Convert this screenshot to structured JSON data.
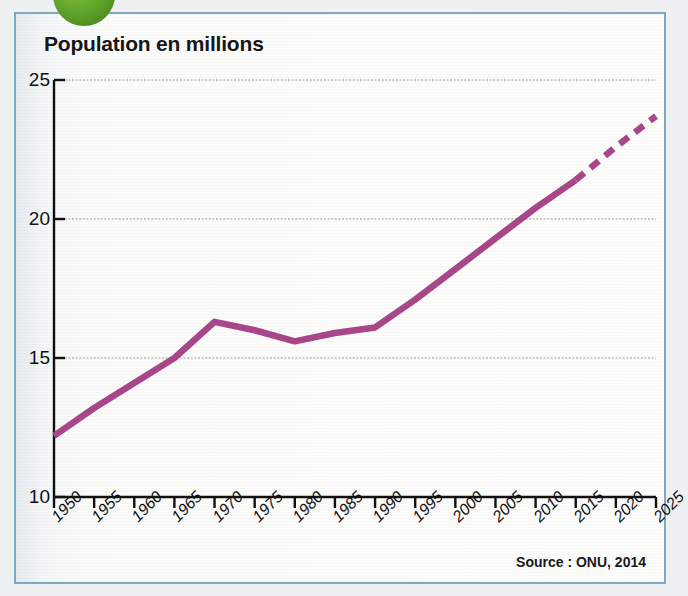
{
  "figure": {
    "title": "Population en millions",
    "source": "Source : ONU, 2014",
    "badge_icon": "green-circle-bullet-icon",
    "frame_color": "#7fa9c4",
    "line_color": "#a8468a",
    "grid_color": "#9aa0a6",
    "axis_color": "#111111",
    "background_color": "#fbfbfa"
  },
  "chart_data": {
    "type": "line",
    "title": "Population en millions",
    "xlabel": "",
    "ylabel": "Population en millions",
    "xlim": [
      1950,
      2025
    ],
    "ylim": [
      10,
      25
    ],
    "yticks": [
      10,
      15,
      20,
      25
    ],
    "ytick_labels": [
      "10",
      "15",
      "20",
      "25"
    ],
    "xticks": [
      1950,
      1955,
      1960,
      1965,
      1970,
      1975,
      1980,
      1985,
      1990,
      1995,
      2000,
      2005,
      2010,
      2015,
      2020,
      2025
    ],
    "xtick_labels": [
      "1950",
      "1955",
      "1960",
      "1965",
      "1970",
      "1975",
      "1980",
      "1985",
      "1990",
      "1995",
      "2000",
      "2005",
      "2010",
      "2015",
      "2020",
      "2025"
    ],
    "grid": "horizontal",
    "legend": "none",
    "series": [
      {
        "name": "Population",
        "style": "solid",
        "color": "#a8468a",
        "x": [
          1950,
          1955,
          1960,
          1965,
          1970,
          1975,
          1980,
          1985,
          1990,
          1995,
          2000,
          2005,
          2010,
          2015
        ],
        "values": [
          12.2,
          13.2,
          14.1,
          15.0,
          16.3,
          16.0,
          15.6,
          15.9,
          16.1,
          17.1,
          18.2,
          19.3,
          20.4,
          21.4
        ]
      },
      {
        "name": "Population (projection)",
        "style": "dashed",
        "color": "#a8468a",
        "x": [
          2015,
          2020,
          2025
        ],
        "values": [
          21.4,
          22.6,
          23.7
        ]
      }
    ],
    "annotations": [
      "Source : ONU, 2014"
    ]
  }
}
